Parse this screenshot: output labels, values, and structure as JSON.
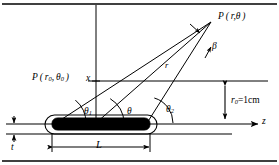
{
  "figure": {
    "background_color": "#ffffff",
    "line_color": "#000000",
    "patch_fill_color": "#000000"
  },
  "labels": {
    "far_field_point": "P ( r,θ )",
    "near_field_point": "P ( r",
    "near_field_point_sub1": "0",
    "near_field_point_mid": ", θ",
    "near_field_point_sub2": "0",
    "near_field_point_end": " )",
    "x_axis": "x",
    "z_axis": "z",
    "radius": "r",
    "beta_angle": "β",
    "theta": "θ",
    "theta1": "θ",
    "theta1_sub": "1",
    "theta2": "θ",
    "theta2_sub": "2",
    "height_label": "r",
    "height_sub": "0",
    "height_value": "=1cm",
    "length_label": "L",
    "thickness_label": "t"
  },
  "geometry": {
    "x_axis_position": 96,
    "z_axis_y": 124,
    "plate_left": 52,
    "plate_right": 150,
    "plate_length_label": "L",
    "substrate_height": "r0 = 1cm",
    "field_point_x": 213,
    "field_point_y": 20
  }
}
